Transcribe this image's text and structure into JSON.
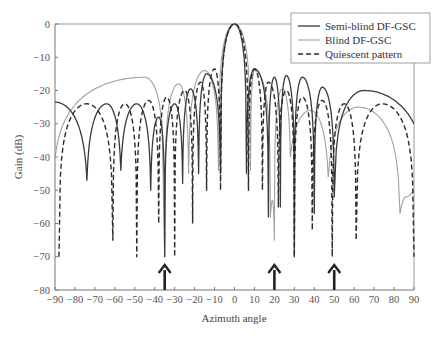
{
  "chart_data": {
    "type": "line",
    "title": "",
    "xlabel": "Azimuth angle",
    "ylabel": "Gain (dB)",
    "xlim": [
      -90,
      90
    ],
    "ylim": [
      -80,
      0
    ],
    "xticks": [
      -90,
      -80,
      -70,
      -60,
      -50,
      -40,
      -30,
      -20,
      -10,
      0,
      10,
      20,
      30,
      40,
      50,
      60,
      70,
      80,
      90
    ],
    "yticks": [
      0,
      -10,
      -20,
      -30,
      -40,
      -50,
      -60,
      -70,
      -80
    ],
    "xtick_labels": [
      "−90",
      "−80",
      "−70",
      "−60",
      "−50",
      "−40",
      "−30",
      "−20",
      "−10",
      "0",
      "10",
      "20",
      "30",
      "40",
      "50",
      "60",
      "70",
      "80",
      "90"
    ],
    "ytick_labels": [
      "0",
      "−10",
      "−20",
      "−30",
      "−40",
      "−50",
      "−60",
      "−70",
      "−80"
    ],
    "grid": false,
    "legend_position": "upper right",
    "legend": [
      "Semi-blind DF-GSC",
      "Blind DF-GSC",
      "Quiescent pattern"
    ],
    "annotations": [
      {
        "type": "arrow",
        "x": -35,
        "label": "interference direction"
      },
      {
        "type": "arrow",
        "x": 20,
        "label": "interference direction"
      },
      {
        "type": "arrow",
        "x": 50,
        "label": "interference direction"
      }
    ],
    "series": [
      {
        "name": "Semi-blind DF-GSC",
        "style": "solid",
        "color": "#3a3a3a",
        "width": 1.3,
        "nulls": [
          [
            -90,
            -23.5,
            "edge"
          ],
          [
            -74,
            -47
          ],
          [
            -57,
            -44
          ],
          [
            -42,
            -50
          ],
          [
            -35,
            -70
          ],
          [
            -26,
            -48
          ],
          [
            -18,
            -45
          ],
          [
            -7,
            -45
          ],
          [
            6,
            -45
          ],
          [
            17,
            -58
          ],
          [
            23,
            -55
          ],
          [
            30,
            -70
          ],
          [
            40,
            -57
          ],
          [
            50,
            -52
          ],
          [
            90,
            -30,
            "edge"
          ]
        ],
        "peaks": [
          [
            -90,
            -23.5
          ],
          [
            -64,
            -24
          ],
          [
            -49,
            -24
          ],
          [
            -38,
            -28
          ],
          [
            -30,
            -24
          ],
          [
            -22,
            -19.5
          ],
          [
            -14,
            -15
          ],
          [
            0,
            0
          ],
          [
            10,
            -13.5
          ],
          [
            14,
            -17
          ],
          [
            20,
            -16
          ],
          [
            26,
            -15.5
          ],
          [
            34,
            -16
          ],
          [
            44,
            -19
          ],
          [
            65,
            -20
          ],
          [
            90,
            -23
          ]
        ]
      },
      {
        "name": "Blind DF-GSC",
        "style": "solid",
        "color": "#a0a0a0",
        "width": 1.1,
        "nulls": [
          [
            -90,
            -40,
            "edge"
          ],
          [
            -35,
            -70
          ],
          [
            -23,
            -45
          ],
          [
            -8,
            -44
          ],
          [
            8,
            -44
          ],
          [
            18,
            -58
          ],
          [
            20,
            -65
          ],
          [
            28,
            -40
          ],
          [
            47,
            -46
          ],
          [
            83,
            -57
          ],
          [
            90,
            -50,
            "edge"
          ]
        ],
        "peaks": [
          [
            -90,
            -40
          ],
          [
            -66,
            -22
          ],
          [
            -45,
            -16
          ],
          [
            -28,
            -18
          ],
          [
            -15,
            -14
          ],
          [
            0,
            0
          ],
          [
            10,
            -14
          ],
          [
            14,
            -20
          ],
          [
            24,
            -19.5
          ],
          [
            38,
            -26
          ],
          [
            62,
            -25
          ],
          [
            86,
            -52
          ]
        ]
      },
      {
        "name": "Quiescent pattern",
        "style": "dashed",
        "color": "#2a2a2a",
        "width": 1.4,
        "nulls": [
          [
            -88,
            -70
          ],
          [
            -61,
            -65
          ],
          [
            -49,
            -70
          ],
          [
            -38,
            -60
          ],
          [
            -30,
            -70
          ],
          [
            -21,
            -60
          ],
          [
            -14,
            -50
          ],
          [
            -7,
            -50
          ],
          [
            7,
            -50
          ],
          [
            14,
            -50
          ],
          [
            22,
            -55
          ],
          [
            30,
            -70
          ],
          [
            39,
            -62
          ],
          [
            49,
            -70
          ],
          [
            61,
            -65
          ],
          [
            90,
            -70
          ]
        ],
        "peaks": [
          [
            -74,
            -24
          ],
          [
            -55,
            -24
          ],
          [
            -43,
            -23
          ],
          [
            -34,
            -22
          ],
          [
            -25,
            -20
          ],
          [
            -17,
            -17.5
          ],
          [
            -10,
            -13.5
          ],
          [
            0,
            0
          ],
          [
            10,
            -13.5
          ],
          [
            17,
            -17.5
          ],
          [
            26,
            -20
          ],
          [
            34,
            -22
          ],
          [
            44,
            -23
          ],
          [
            55,
            -24
          ],
          [
            74,
            -24
          ]
        ]
      }
    ]
  }
}
